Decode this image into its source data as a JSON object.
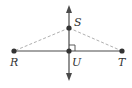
{
  "diagram": {
    "type": "geometry",
    "colors": {
      "solid_line": "#4a4a4a",
      "dashed_line": "#b0b0b0",
      "point": "#333333",
      "label": "#333333"
    },
    "points": [
      {
        "id": "R",
        "label": "R",
        "x": 14,
        "y": 51
      },
      {
        "id": "T",
        "label": "T",
        "x": 122,
        "y": 51
      },
      {
        "id": "U",
        "label": "U",
        "x": 69,
        "y": 51
      },
      {
        "id": "S",
        "label": "S",
        "x": 69,
        "y": 28
      }
    ],
    "segments": [
      {
        "from": "R",
        "to": "T",
        "style": "solid"
      },
      {
        "from": "S",
        "to": "R",
        "style": "dashed"
      },
      {
        "from": "S",
        "to": "T",
        "style": "dashed"
      }
    ],
    "lines": [
      {
        "name": "perpendicular line through S and U",
        "style": "solid",
        "arrows": "both",
        "x": 69,
        "y_top": 6,
        "y_bottom": 80
      }
    ],
    "marks": [
      {
        "type": "right-angle",
        "at": "U"
      }
    ],
    "labels": {
      "R": "R",
      "T": "T",
      "U": "U",
      "S": "S"
    }
  }
}
